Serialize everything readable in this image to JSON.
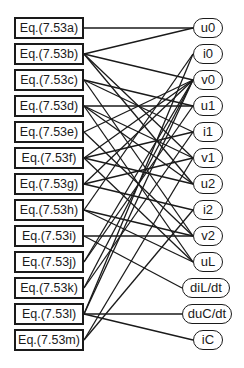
{
  "diagram": {
    "type": "bipartite-graph",
    "equations": [
      {
        "id": "a",
        "label": "Eq.(7.53a)"
      },
      {
        "id": "b",
        "label": "Eq.(7.53b)"
      },
      {
        "id": "c",
        "label": "Eq.(7.53c)"
      },
      {
        "id": "d",
        "label": "Eq.(7.53d)"
      },
      {
        "id": "e",
        "label": "Eq.(7.53e)"
      },
      {
        "id": "f",
        "label": "Eq.(7.53f)"
      },
      {
        "id": "g",
        "label": "Eq.(7.53g)"
      },
      {
        "id": "h",
        "label": "Eq.(7.53h)"
      },
      {
        "id": "i",
        "label": "Eq.(7.53i)"
      },
      {
        "id": "j",
        "label": "Eq.(7.53j)"
      },
      {
        "id": "k",
        "label": "Eq.(7.53k)"
      },
      {
        "id": "l",
        "label": "Eq.(7.53l)"
      },
      {
        "id": "m",
        "label": "Eq.(7.53m)"
      }
    ],
    "variables": [
      {
        "id": "u0",
        "label": "u0"
      },
      {
        "id": "i0",
        "label": "i0"
      },
      {
        "id": "v0",
        "label": "v0"
      },
      {
        "id": "u1",
        "label": "u1"
      },
      {
        "id": "i1",
        "label": "i1"
      },
      {
        "id": "v1",
        "label": "v1"
      },
      {
        "id": "u2",
        "label": "u2"
      },
      {
        "id": "i2",
        "label": "i2"
      },
      {
        "id": "v2",
        "label": "v2"
      },
      {
        "id": "uL",
        "label": "uL"
      },
      {
        "id": "diLdt",
        "label": "diL/dt"
      },
      {
        "id": "duCdt",
        "label": "duC/dt"
      },
      {
        "id": "iC",
        "label": "iC"
      }
    ],
    "edges": [
      [
        "a",
        "u0"
      ],
      [
        "b",
        "u0"
      ],
      [
        "b",
        "v0"
      ],
      [
        "b",
        "v1"
      ],
      [
        "b",
        "u2"
      ],
      [
        "c",
        "u1"
      ],
      [
        "c",
        "i1"
      ],
      [
        "c",
        "v2"
      ],
      [
        "d",
        "u1"
      ],
      [
        "d",
        "v1"
      ],
      [
        "d",
        "u2"
      ],
      [
        "d",
        "uL"
      ],
      [
        "e",
        "v0"
      ],
      [
        "e",
        "v2"
      ],
      [
        "f",
        "v0"
      ],
      [
        "f",
        "i1"
      ],
      [
        "f",
        "u2"
      ],
      [
        "f",
        "uL"
      ],
      [
        "g",
        "v0"
      ],
      [
        "g",
        "v1"
      ],
      [
        "g",
        "i2"
      ],
      [
        "h",
        "i0"
      ],
      [
        "h",
        "v2"
      ],
      [
        "h",
        "uL"
      ],
      [
        "i",
        "v2"
      ],
      [
        "i",
        "diLdt"
      ],
      [
        "j",
        "v0"
      ],
      [
        "j",
        "u1"
      ],
      [
        "k",
        "v0"
      ],
      [
        "k",
        "i1"
      ],
      [
        "l",
        "i0"
      ],
      [
        "l",
        "v0"
      ],
      [
        "l",
        "iC"
      ],
      [
        "l",
        "duCdt"
      ],
      [
        "m",
        "i2"
      ],
      [
        "m",
        "v1"
      ]
    ],
    "colors": {
      "stroke": "#1a1a1a",
      "background": "#ffffff"
    }
  }
}
